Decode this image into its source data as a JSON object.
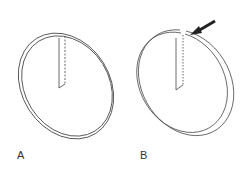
{
  "figure": {
    "panels": [
      {
        "label": "A",
        "description": "Ring with a closed overlapping tab"
      },
      {
        "label": "B",
        "description": "Ring with a cut gap, indicated by arrow"
      }
    ],
    "colors": {
      "stroke": "#333333",
      "background": "#ffffff",
      "arrow": "#222222"
    }
  }
}
